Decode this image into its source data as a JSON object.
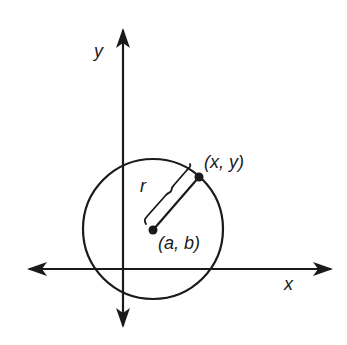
{
  "diagram": {
    "axes": {
      "x_label": "x",
      "y_label": "y"
    },
    "circle": {
      "center_label": "(a, b)",
      "point_label": "(x, y)",
      "radius_label": "r"
    },
    "colors": {
      "ink": "#1a1a1a",
      "background": "#ffffff"
    }
  }
}
